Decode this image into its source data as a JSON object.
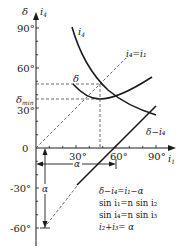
{
  "diagram": {
    "y_axis": {
      "label_delta": "δ",
      "label_i4": "i",
      "label_i4_sub": "4"
    },
    "x_axis": {
      "label": "i",
      "label_sub": "1"
    },
    "y_ticks": [
      {
        "label": "90°",
        "value": 90
      },
      {
        "label": "60°",
        "value": 60
      },
      {
        "label": "30°",
        "value": 30
      },
      {
        "label": "0",
        "value": 0
      },
      {
        "label": "-30°",
        "value": -30
      },
      {
        "label": "-60°",
        "value": -60
      }
    ],
    "x_ticks": [
      {
        "label": "30°",
        "value": 30
      },
      {
        "label": "60°",
        "value": 60
      },
      {
        "label": "90°",
        "value": 90
      }
    ],
    "delta_min_label": "δ",
    "delta_min_sub": "min",
    "curve_labels": {
      "i4": "i",
      "i4_sub": "4",
      "delta": "δ",
      "diag_line": "i₄=i₁",
      "delta_minus_i4": "δ−i₄"
    },
    "alpha_label": "α",
    "equations": [
      "δ−i₄=i₁−α",
      "sin i₁=n sin i₂",
      "sin i₄=n sin i₃",
      "i₂+i₃= α"
    ],
    "colors": {
      "line": "#1a1a1a",
      "dash": "#444444"
    }
  }
}
